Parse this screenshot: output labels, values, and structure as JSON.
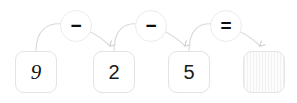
{
  "diagram": {
    "colors": {
      "background": "#ffffff",
      "box_border": "#e3e3e3",
      "circle_border": "#ececec",
      "arc_stroke": "#d6d6d6",
      "digit": "#111111",
      "operator": "#0d0d0d",
      "empty_box_fill": "#f2f2f2"
    },
    "operands": [
      {
        "id": "operand-1",
        "value": "9",
        "style": "italic",
        "filled": true
      },
      {
        "id": "operand-2",
        "value": "2",
        "style": "normal",
        "filled": true
      },
      {
        "id": "operand-3",
        "value": "5",
        "style": "normal",
        "filled": true
      },
      {
        "id": "answer",
        "value": "",
        "style": "normal",
        "filled": false
      }
    ],
    "operators": [
      {
        "id": "operator-1",
        "symbol": "−",
        "name": "minus-sign"
      },
      {
        "id": "operator-2",
        "symbol": "−",
        "name": "minus-sign"
      },
      {
        "id": "operator-3",
        "symbol": "=",
        "name": "equals-sign"
      }
    ],
    "arrows": [
      {
        "id": "arrow-1",
        "from": "operand-1",
        "to": "operand-2",
        "through": "operator-1"
      },
      {
        "id": "arrow-2",
        "from": "operand-2",
        "to": "operand-3",
        "through": "operator-2"
      },
      {
        "id": "arrow-3",
        "from": "operand-3",
        "to": "answer",
        "through": "operator-3"
      }
    ],
    "expression": "9 − 2 − 5 ="
  }
}
